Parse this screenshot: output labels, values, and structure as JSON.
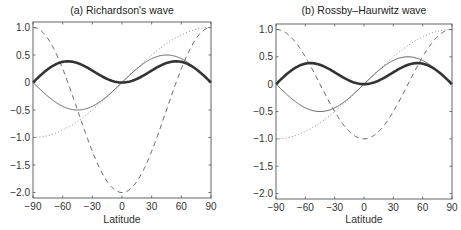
{
  "chart_data": [
    {
      "type": "line",
      "title": "(a) Richardson's wave",
      "xlabel": "Latitude",
      "ylabel": "",
      "xlim": [
        -90,
        90
      ],
      "ylim": [
        -2.1,
        1.1
      ],
      "xticks": [
        -90,
        -60,
        -30,
        0,
        30,
        60,
        90
      ],
      "xtick_labels": [
        "−90",
        "−60",
        "−30",
        "0",
        "30",
        "60",
        "90"
      ],
      "yticks": [
        1.0,
        0.5,
        0,
        -0.5,
        -1.0,
        -1.5,
        -2.0
      ],
      "ytick_labels": [
        "1.0",
        "0.5",
        "0",
        "−0.5",
        "−1.0",
        "−1.5",
        "−2.0"
      ],
      "grid": false,
      "legend": null,
      "x": [
        -90,
        -75,
        -60,
        -45,
        -30,
        -15,
        0,
        15,
        30,
        45,
        60,
        75,
        90
      ],
      "series": [
        {
          "name": "thick solid",
          "style": "thick",
          "values": [
            0,
            0.24,
            0.375,
            0.354,
            0.217,
            0.065,
            0,
            0.065,
            0.217,
            0.354,
            0.375,
            0.24,
            0
          ]
        },
        {
          "name": "thin solid",
          "style": "thin",
          "values": [
            0,
            -0.25,
            -0.433,
            -0.5,
            -0.433,
            -0.25,
            0,
            0.25,
            0.433,
            0.5,
            0.433,
            0.25,
            0
          ]
        },
        {
          "name": "dotted",
          "style": "dotted",
          "values": [
            -1,
            -0.966,
            -0.866,
            -0.707,
            -0.5,
            -0.259,
            0,
            0.259,
            0.5,
            0.707,
            0.866,
            0.966,
            1
          ]
        },
        {
          "name": "dashed",
          "style": "dashed",
          "values": [
            1,
            0.799,
            0.25,
            -0.5,
            -1.25,
            -1.799,
            -2,
            -1.799,
            -1.25,
            -0.5,
            0.25,
            0.799,
            1
          ]
        }
      ],
      "formulas": {
        "thick": "cos*sin^2",
        "thin": "sin*cos",
        "dotted": "sin",
        "dashed": "3sin^2-2"
      }
    },
    {
      "type": "line",
      "title": "(b) Rossby–Haurwitz wave",
      "xlabel": "Latitude",
      "ylabel": "",
      "xlim": [
        -90,
        90
      ],
      "ylim": [
        -2.1,
        1.1
      ],
      "xticks": [
        -90,
        -60,
        -30,
        0,
        30,
        60,
        90
      ],
      "xtick_labels": [
        "−90",
        "−60",
        "−30",
        "0",
        "30",
        "60",
        "90"
      ],
      "yticks": [
        1.0,
        0.5,
        0,
        -0.5,
        -1.0,
        -1.5,
        -2.0
      ],
      "ytick_labels": [
        "1.0",
        "0.5",
        "0",
        "−0.5",
        "−1.0",
        "−1.5",
        "−2.0"
      ],
      "grid": false,
      "legend": null,
      "x": [
        -90,
        -75,
        -60,
        -45,
        -30,
        -15,
        0,
        15,
        30,
        45,
        60,
        75,
        90
      ],
      "series": [
        {
          "name": "thick solid",
          "style": "thick",
          "values": [
            0,
            0.24,
            0.375,
            0.354,
            0.217,
            0.065,
            0,
            0.065,
            0.217,
            0.354,
            0.375,
            0.24,
            0
          ]
        },
        {
          "name": "thin solid",
          "style": "thin",
          "values": [
            0,
            -0.25,
            -0.433,
            -0.5,
            -0.433,
            -0.25,
            0,
            0.25,
            0.433,
            0.5,
            0.433,
            0.25,
            0
          ]
        },
        {
          "name": "dotted",
          "style": "dotted",
          "values": [
            -1,
            -0.966,
            -0.866,
            -0.707,
            -0.5,
            -0.259,
            0,
            0.259,
            0.5,
            0.707,
            0.866,
            0.966,
            1
          ]
        },
        {
          "name": "dashed",
          "style": "dashed",
          "values": [
            1,
            0.866,
            0.5,
            0,
            -0.5,
            -0.866,
            -1,
            -0.866,
            -0.5,
            0,
            0.5,
            0.866,
            1
          ]
        }
      ],
      "formulas": {
        "thick": "cos*sin^2",
        "thin": "sin*cos",
        "dotted": "sin",
        "dashed": "2sin^2-1"
      }
    }
  ]
}
